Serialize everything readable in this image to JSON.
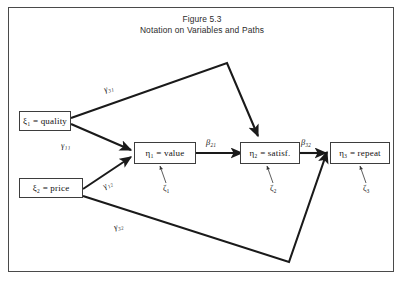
{
  "figure": {
    "title": "Figure 5.3",
    "subtitle": "Notation on Variables and Paths",
    "border_color": "#4a4a4a",
    "background": "#ffffff",
    "path_color": "#1a1a1a",
    "text_color": "#111111"
  },
  "nodes": [
    {
      "id": "xi1",
      "symbol": "ξ",
      "sub": "1",
      "equals": "=",
      "name": "quality",
      "label": "ξ₁ = quality"
    },
    {
      "id": "xi2",
      "symbol": "ξ",
      "sub": "2",
      "equals": "=",
      "name": "price",
      "label": "ξ₂ = price"
    },
    {
      "id": "eta1",
      "symbol": "η",
      "sub": "1",
      "equals": "=",
      "name": "value",
      "label": "η₁ = value"
    },
    {
      "id": "eta2",
      "symbol": "η",
      "sub": "2",
      "equals": "=",
      "name": "satisf.",
      "label": "η₂ = satisf."
    },
    {
      "id": "eta3",
      "symbol": "η",
      "sub": "3",
      "equals": "=",
      "name": "repeat",
      "label": "η₃ = repeat"
    }
  ],
  "paths": [
    {
      "id": "g31",
      "symbol": "γ",
      "sub": "31",
      "from": "xi1",
      "to": "eta2",
      "label": "γ₃₁"
    },
    {
      "id": "g11",
      "symbol": "γ",
      "sub": "11",
      "from": "xi1",
      "to": "eta1",
      "label": "γ₁₁"
    },
    {
      "id": "g12",
      "symbol": "γ",
      "sub": "12",
      "from": "xi2",
      "to": "eta1",
      "label": "γ₁₂"
    },
    {
      "id": "g32",
      "symbol": "γ",
      "sub": "32",
      "from": "xi2",
      "to": "eta3",
      "label": "γ₃₂"
    },
    {
      "id": "b21",
      "symbol": "β",
      "sub": "21",
      "from": "eta1",
      "to": "eta2",
      "label": "β₂₁"
    },
    {
      "id": "b32",
      "symbol": "β",
      "sub": "32",
      "from": "eta2",
      "to": "eta3",
      "label": "β₃₂"
    }
  ],
  "disturbances": [
    {
      "id": "z1",
      "symbol": "ζ",
      "sub": "1",
      "target": "eta1",
      "label": "ζ₁"
    },
    {
      "id": "z2",
      "symbol": "ζ",
      "sub": "2",
      "target": "eta2",
      "label": "ζ₂"
    },
    {
      "id": "z3",
      "symbol": "ζ",
      "sub": "3",
      "target": "eta3",
      "label": "ζ₃"
    }
  ]
}
